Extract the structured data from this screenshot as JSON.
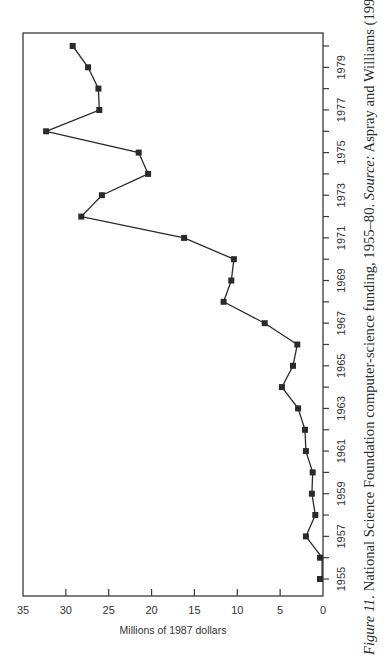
{
  "chart_data": {
    "type": "line",
    "title": "",
    "xlabel": "",
    "ylabel": "Millions of 1987 dollars",
    "x": [
      1955,
      1956,
      1957,
      1958,
      1959,
      1960,
      1961,
      1962,
      1963,
      1964,
      1965,
      1966,
      1967,
      1968,
      1969,
      1970,
      1971,
      1972,
      1973,
      1974,
      1975,
      1976,
      1977,
      1978,
      1979,
      1980
    ],
    "series": [
      {
        "name": "NSF computer-science funding",
        "values": [
          0.1,
          0.1,
          2.0,
          0.9,
          1.3,
          1.2,
          2.0,
          2.1,
          2.9,
          4.8,
          3.5,
          3.0,
          6.8,
          11.6,
          10.7,
          10.4,
          16.2,
          28.2,
          25.8,
          20.4,
          21.5,
          32.3,
          26.1,
          26.2,
          27.4,
          29.2
        ]
      }
    ],
    "xticks": [
      1955,
      1957,
      1959,
      1961,
      1963,
      1965,
      1967,
      1969,
      1971,
      1973,
      1975,
      1977,
      1979
    ],
    "yticks": [
      0,
      5,
      10,
      15,
      20,
      25,
      30,
      35
    ],
    "xlim": [
      1954.4,
      1980.6
    ],
    "ylim": [
      0,
      35
    ],
    "grid": false,
    "legend": "none",
    "marker": "square",
    "orientation_note": "figure rotated 90 degrees counter-clockwise on page",
    "caption": {
      "label": "Figure 11.",
      "text": " National Science Foundation computer-science funding, 1955–80. ",
      "source_label": "Source:",
      "source_text": " Aspray and Williams (1994)."
    }
  },
  "colors": {
    "line": "#2a2a2a",
    "axis": "#3a3a3a",
    "text": "#333333",
    "background": "#ffffff"
  }
}
